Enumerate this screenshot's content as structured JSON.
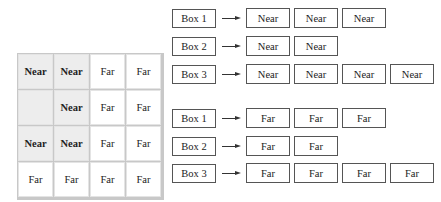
{
  "grid": {
    "rows": [
      [
        {
          "text": "Near",
          "shaded": true,
          "bold": true
        },
        {
          "text": "Near",
          "shaded": true,
          "bold": true
        },
        {
          "text": "Far",
          "shaded": false,
          "bold": false
        },
        {
          "text": "Far",
          "shaded": false,
          "bold": false
        }
      ],
      [
        {
          "text": "",
          "shaded": true,
          "bold": false
        },
        {
          "text": "Near",
          "shaded": true,
          "bold": true
        },
        {
          "text": "Far",
          "shaded": false,
          "bold": false
        },
        {
          "text": "Far",
          "shaded": false,
          "bold": false
        }
      ],
      [
        {
          "text": "Near",
          "shaded": true,
          "bold": true
        },
        {
          "text": "Near",
          "shaded": true,
          "bold": true
        },
        {
          "text": "Far",
          "shaded": false,
          "bold": false
        },
        {
          "text": "Far",
          "shaded": false,
          "bold": false
        }
      ],
      [
        {
          "text": "Far",
          "shaded": false,
          "bold": false
        },
        {
          "text": "Far",
          "shaded": false,
          "bold": false
        },
        {
          "text": "Far",
          "shaded": false,
          "bold": false
        },
        {
          "text": "Far",
          "shaded": false,
          "bold": false
        }
      ]
    ]
  },
  "near_group": [
    {
      "label": "Box 1",
      "outputs": [
        "Near",
        "Near",
        "Near"
      ]
    },
    {
      "label": "Box 2",
      "outputs": [
        "Near",
        "Near"
      ]
    },
    {
      "label": "Box 3",
      "outputs": [
        "Near",
        "Near",
        "Near",
        "Near"
      ]
    }
  ],
  "far_group": [
    {
      "label": "Box 1",
      "outputs": [
        "Far",
        "Far",
        "Far"
      ]
    },
    {
      "label": "Box 2",
      "outputs": [
        "Far",
        "Far"
      ]
    },
    {
      "label": "Box 3",
      "outputs": [
        "Far",
        "Far",
        "Far",
        "Far"
      ]
    }
  ]
}
